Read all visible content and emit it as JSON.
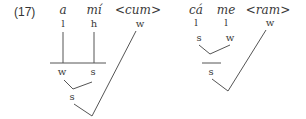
{
  "example": {
    "number": "(17)"
  },
  "trees": [
    {
      "id": "left",
      "words": [
        "a",
        "mí",
        "<cum>"
      ],
      "tones": [
        "l",
        "h",
        "w"
      ],
      "level2": [
        "w",
        "s"
      ],
      "level3": "s"
    },
    {
      "id": "right",
      "words": [
        "cá",
        "me",
        "<ram>"
      ],
      "tones": [
        "l",
        "l",
        "w"
      ],
      "level2": [
        "s",
        "w"
      ],
      "level3": "s"
    }
  ],
  "colors": {
    "line": "#555555",
    "text": "#3a3a3a"
  }
}
